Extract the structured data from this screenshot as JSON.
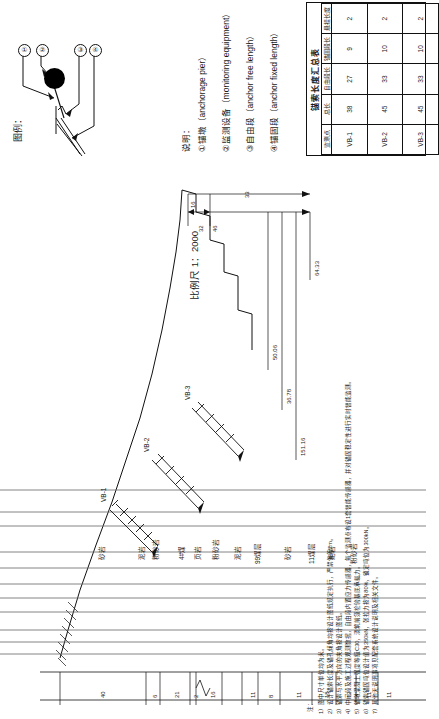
{
  "legend": {
    "title": "图例：",
    "callouts": [
      "①",
      "②",
      "③",
      "④"
    ]
  },
  "explanation": {
    "title": "说明：",
    "items": [
      "①锚墩（anchorage pier）",
      "②监测设备（monitoring equipment）",
      "③自由段（anchor free length）",
      "④锚固段（anchor fixed length）"
    ]
  },
  "scale": {
    "label": "比例尺 1：2000"
  },
  "table": {
    "caption": "锚索长度汇总表",
    "headers": [
      "监测点",
      "总长",
      "自由段长",
      "锚固段长",
      "悬挂长度"
    ],
    "rows": [
      [
        "VB-1",
        "38",
        "27",
        "9",
        "2"
      ],
      [
        "VB-2",
        "45",
        "33",
        "10",
        "2"
      ],
      [
        "VB-3",
        "45",
        "33",
        "10",
        "2"
      ]
    ]
  },
  "drawing": {
    "anchor_tags": [
      "VB-1",
      "VB-2",
      "VB-3"
    ],
    "strata": [
      "砂岩",
      "泥岩",
      "粉砂岩",
      "4#煤",
      "页岩",
      "粉砂岩",
      "泥岩",
      "99煤层",
      "砂岩",
      "11煤层",
      "泥岩",
      "粉砂岩"
    ],
    "top_dimensions": [
      "16",
      "32",
      "46",
      "33"
    ],
    "slope_dimensions": [
      "50.06",
      "36.78",
      "151.16",
      "64.33"
    ],
    "bottom_dimensions": [
      "40",
      "6",
      "21",
      "2",
      "16",
      "11",
      "8",
      "11",
      "18",
      "12",
      "11",
      "11"
    ]
  },
  "notes": {
    "title": "注：",
    "items": [
      "1）图中尺寸单位均为米。",
      "2）设计锚索长度及锚孔倾角均按设计图纸规定执行，严禁偏差2m。",
      "3）锚索与水平方向的夹角按设计图纸。",
      "4）中间段及施工过程观测数据，自由段内置应力传感器，每个监测点布设1套智能传感器，并对锚固稳定性进行实时智能监测。",
      "5）锚墩混凝土强度等级C30，浇筑前须检验基底承载力。",
      "6）锚索锚固吨位设计值为350kN，张拉力按为80%，锁定吨位为300kN。",
      "7）其他无说明事项见配套系统设计说明及相关文件。"
    ]
  }
}
